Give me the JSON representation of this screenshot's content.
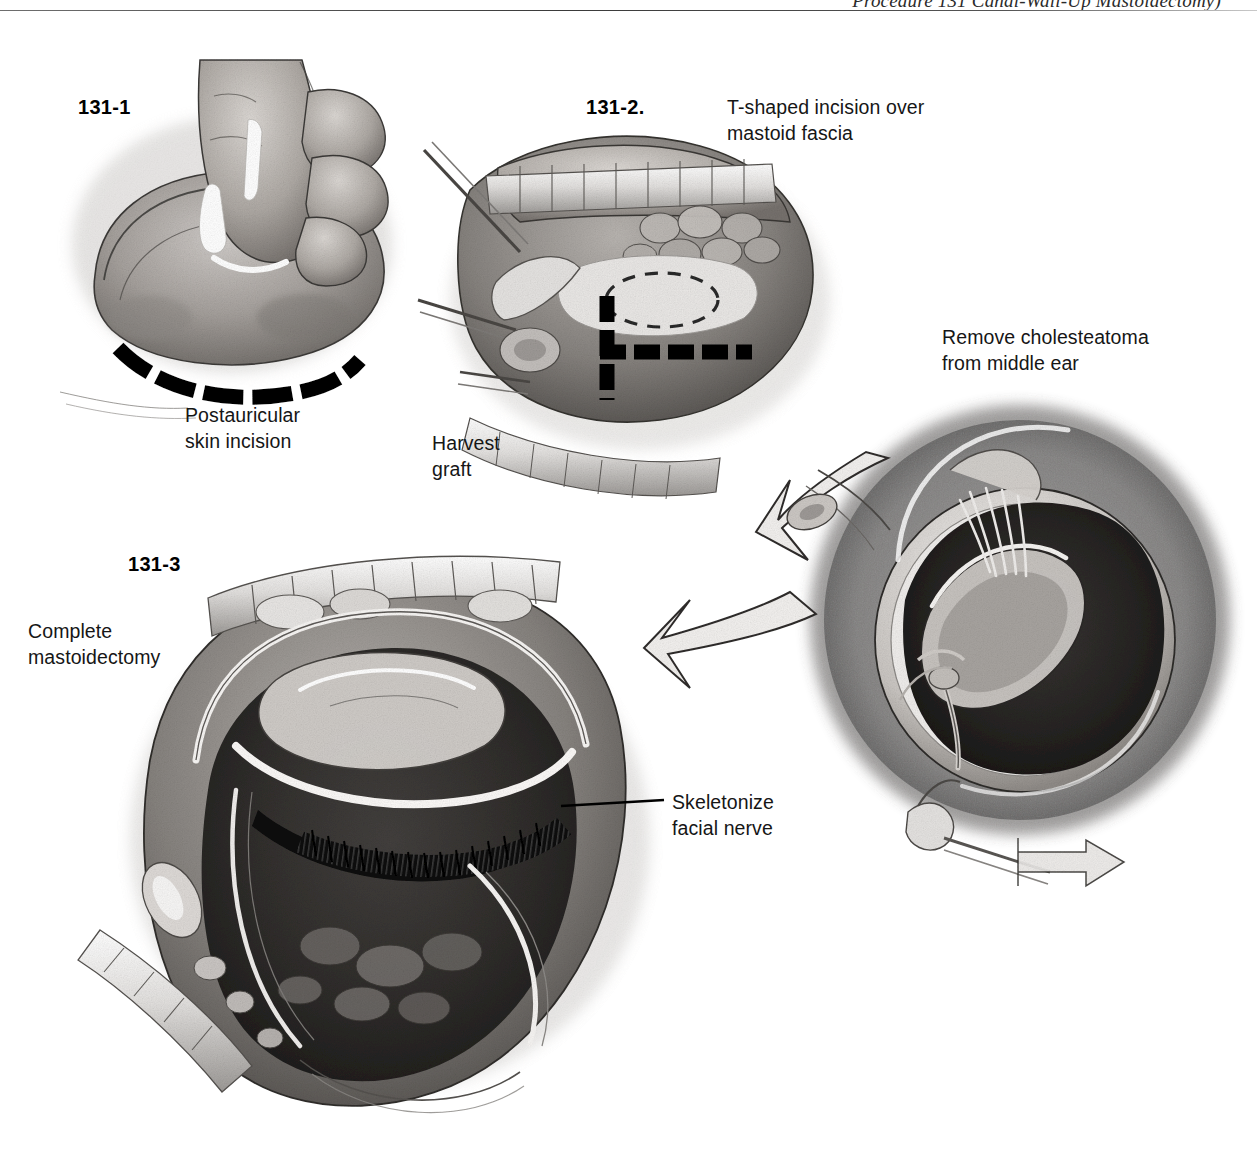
{
  "page": {
    "running_title": "Procedure 131  Canal-Wall-Up Mastoidectomy)",
    "width": 1257,
    "height": 1165,
    "background": "#ffffff",
    "ink": "#161616"
  },
  "figures": [
    {
      "id": "131-1",
      "number": "131-1",
      "caption": "Postauricular\nskin incision",
      "description": "Surgeon's hand retracting the auricle forward with a marking pen; bold dashed postauricular incision line marked behind the ear."
    },
    {
      "id": "131-2",
      "number": "131-2.",
      "caption": "T-shaped incision over\nmastoid fascia",
      "sub_caption": "Harvest\ngraft",
      "description": "Retracted postauricular flap exposing mastoid fascia; bold dashed T-shaped incision and dashed oval outline of the temporalis fascia graft to be harvested."
    },
    {
      "id": "131-3",
      "number": "131-3",
      "caption": "Complete\nmastoidectomy",
      "annotation": "Skeletonize\nfacial nerve",
      "description": "Completed canal-wall-up mastoidectomy cavity with self-retaining retractor; hatched dark band marks the skeletonized vertical segment of the facial nerve."
    },
    {
      "id": "middle-ear",
      "caption": "Remove cholesteatoma\nfrom middle ear",
      "description": "Middle-ear view through the external canal with tympanomeatal flap elevated, ossicles visible, and instruments removing cholesteatoma."
    }
  ],
  "labels": {
    "fig1_number": "131-1",
    "fig1_caption": "Postauricular\nskin incision",
    "fig2_number": "131-2.",
    "fig2_caption": "T-shaped incision over\nmastoid fascia",
    "fig2_graft": "Harvest\ngraft",
    "fig3_number": "131-3",
    "fig3_caption": "Complete\nmastoidectomy",
    "fig3_nerve": "Skeletonize\nfacial nerve",
    "middle_ear_caption": "Remove cholesteatoma\nfrom middle ear"
  },
  "colors": {
    "ink_black": "#000000",
    "text": "#161616",
    "rule": "#4a4a4a",
    "wash_light": "#e6e4e2",
    "wash_mid": "#a9a6a3",
    "wash_dark": "#4e4b49",
    "wash_deep": "#23211f"
  }
}
